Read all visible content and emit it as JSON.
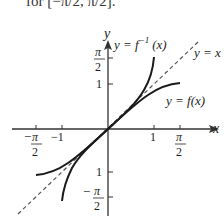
{
  "caption_fragment": "for [−π/2, π/2].",
  "axes": {
    "x_label": "x",
    "y_label": "y"
  },
  "x_ticks": [
    {
      "value": -1.5708,
      "label_num": "π",
      "label_den": "2",
      "sign": "−"
    },
    {
      "value": -1,
      "label": "−1"
    },
    {
      "value": 1,
      "label": "1"
    },
    {
      "value": 1.5708,
      "label_num": "π",
      "label_den": "2",
      "sign": ""
    }
  ],
  "y_ticks": [
    {
      "value": 1.5708,
      "label_num": "π",
      "label_den": "2",
      "sign": ""
    },
    {
      "value": 1,
      "label": "1"
    },
    {
      "value": -1,
      "label": "1"
    },
    {
      "value": -1.5708,
      "label_num": "π",
      "label_den": "2",
      "sign": "−"
    }
  ],
  "curves": {
    "inverse": {
      "label": "y = f",
      "sup": "−1",
      "suffix": "(x)",
      "desc": "arcsin x on [−1, 1]"
    },
    "function": {
      "label": "y = f(x)",
      "desc": "sin x on [−π/2, π/2]"
    },
    "identity": {
      "label": "y = x",
      "style": "dashed"
    }
  },
  "colors": {
    "curve": "#1a1a1a",
    "axis": "#333333",
    "dashed": "#555555"
  }
}
